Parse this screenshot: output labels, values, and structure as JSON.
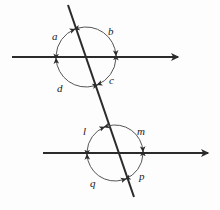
{
  "figure": {
    "background_color": "#fdfdfd",
    "stroke_color": "#2b2b2b",
    "arc_color": "#555555",
    "line_width": 2,
    "arc_width": 1
  },
  "lines": [
    {
      "name": "upper-parallel-line",
      "kind": "ray",
      "x1": 12,
      "y1": 57,
      "x2": 178,
      "y2": 57,
      "arrow_end": true,
      "arrow_start": false
    },
    {
      "name": "lower-parallel-line",
      "kind": "ray",
      "x1": 43,
      "y1": 153,
      "x2": 208,
      "y2": 153,
      "arrow_end": true,
      "arrow_start": false
    },
    {
      "name": "transversal-line",
      "kind": "segment",
      "x1": 68,
      "y1": 5,
      "x2": 134,
      "y2": 197,
      "arrow_end": false,
      "arrow_start": false
    }
  ],
  "intersections": [
    {
      "name": "upper-intersection",
      "cx": 86,
      "cy": 57,
      "circle_radius": 30
    },
    {
      "name": "lower-intersection",
      "cx": 115,
      "cy": 153,
      "circle_radius": 28
    }
  ],
  "angles": [
    {
      "id": "a",
      "label": "a",
      "vertex": "upper-intersection",
      "position": "upper-left",
      "label_x": 52,
      "label_y": 31
    },
    {
      "id": "b",
      "label": "b",
      "vertex": "upper-intersection",
      "position": "upper-right",
      "label_x": 108,
      "label_y": 26
    },
    {
      "id": "c",
      "label": "c",
      "vertex": "upper-intersection",
      "position": "lower-right",
      "label_x": 109,
      "label_y": 75
    },
    {
      "id": "d",
      "label": "d",
      "vertex": "upper-intersection",
      "position": "lower-left",
      "label_x": 57,
      "label_y": 83
    },
    {
      "id": "l",
      "label": "l",
      "vertex": "lower-intersection",
      "position": "upper-left",
      "label_x": 83,
      "label_y": 126
    },
    {
      "id": "m",
      "label": "m",
      "vertex": "lower-intersection",
      "position": "upper-right",
      "label_x": 137,
      "label_y": 126
    },
    {
      "id": "p",
      "label": "p",
      "vertex": "lower-intersection",
      "position": "lower-right",
      "label_x": 139,
      "label_y": 171
    },
    {
      "id": "q",
      "label": "q",
      "vertex": "lower-intersection",
      "position": "lower-left",
      "label_x": 90,
      "label_y": 178
    }
  ],
  "arcs": [
    {
      "name": "arc-a",
      "angle_id": "a",
      "cx": 86,
      "cy": 57,
      "r": 30,
      "start_deg": 180,
      "end_deg": 251,
      "double_arrow": true
    },
    {
      "name": "arc-b",
      "angle_id": "b",
      "cx": 86,
      "cy": 57,
      "r": 30,
      "start_deg": 251,
      "end_deg": 360,
      "double_arrow": true
    },
    {
      "name": "arc-c",
      "angle_id": "c",
      "cx": 86,
      "cy": 57,
      "r": 30,
      "start_deg": 0,
      "end_deg": 71,
      "double_arrow": true
    },
    {
      "name": "arc-d",
      "angle_id": "d",
      "cx": 86,
      "cy": 57,
      "r": 30,
      "start_deg": 71,
      "end_deg": 180,
      "double_arrow": true
    },
    {
      "name": "arc-l",
      "angle_id": "l",
      "cx": 115,
      "cy": 153,
      "r": 28,
      "start_deg": 180,
      "end_deg": 251,
      "double_arrow": true
    },
    {
      "name": "arc-m",
      "angle_id": "m",
      "cx": 115,
      "cy": 153,
      "r": 28,
      "start_deg": 251,
      "end_deg": 360,
      "double_arrow": true
    },
    {
      "name": "arc-p",
      "angle_id": "p",
      "cx": 115,
      "cy": 153,
      "r": 28,
      "start_deg": 0,
      "end_deg": 71,
      "double_arrow": true
    },
    {
      "name": "arc-q",
      "angle_id": "q",
      "cx": 115,
      "cy": 153,
      "r": 28,
      "start_deg": 71,
      "end_deg": 180,
      "double_arrow": true
    }
  ]
}
